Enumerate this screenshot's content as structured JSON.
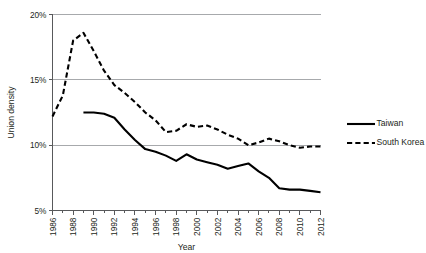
{
  "chart_data": {
    "type": "line",
    "title": "",
    "xlabel": "Year",
    "ylabel": "Union density",
    "xlim": [
      1986,
      2012
    ],
    "ylim": [
      5,
      20
    ],
    "y_tick_labels": [
      "5%",
      "10%",
      "15%",
      "20%"
    ],
    "y_ticks": [
      5,
      10,
      15,
      20
    ],
    "x_tick_labels": [
      "1986",
      "1988",
      "1990",
      "1992",
      "1994",
      "1996",
      "1998",
      "2000",
      "2002",
      "2004",
      "2006",
      "2008",
      "2010",
      "2012"
    ],
    "x_ticks": [
      1986,
      1988,
      1990,
      1992,
      1994,
      1996,
      1998,
      2000,
      2002,
      2004,
      2006,
      2008,
      2010,
      2012
    ],
    "grid": "horizontal",
    "legend_position": "right",
    "y_axis_unit": "percent",
    "colors": {
      "line": "#000000",
      "gridline": "#a7a9ac",
      "axis": "#58595b",
      "text": "#231f20",
      "background": "#ffffff"
    },
    "x": [
      1986,
      1987,
      1988,
      1989,
      1990,
      1991,
      1992,
      1993,
      1994,
      1995,
      1996,
      1997,
      1998,
      1999,
      2000,
      2001,
      2002,
      2003,
      2004,
      2005,
      2006,
      2007,
      2008,
      2009,
      2010,
      2011,
      2012
    ],
    "series": [
      {
        "name": "Taiwan",
        "style": "solid",
        "x": [
          1989,
          1990,
          1991,
          1992,
          1993,
          1994,
          1995,
          1996,
          1997,
          1998,
          1999,
          2000,
          2001,
          2002,
          2003,
          2004,
          2005,
          2006,
          2007,
          2008,
          2009,
          2010,
          2011,
          2012
        ],
        "values": [
          12.5,
          12.5,
          12.4,
          12.1,
          11.2,
          10.4,
          9.7,
          9.5,
          9.2,
          8.8,
          9.3,
          8.9,
          8.7,
          8.5,
          8.2,
          8.4,
          8.6,
          8.0,
          7.5,
          6.7,
          6.6,
          6.6,
          6.5,
          6.4
        ]
      },
      {
        "name": "South Korea",
        "style": "dashed",
        "x": [
          1986,
          1987,
          1988,
          1989,
          1990,
          1991,
          1992,
          1993,
          1994,
          1995,
          1996,
          1997,
          1998,
          1999,
          2000,
          2001,
          2002,
          2003,
          2004,
          2005,
          2006,
          2007,
          2008,
          2009,
          2010,
          2011,
          2012
        ],
        "values": [
          12.2,
          13.8,
          18.0,
          18.6,
          17.2,
          15.7,
          14.6,
          14.0,
          13.3,
          12.5,
          11.9,
          11.0,
          11.1,
          11.6,
          11.4,
          11.5,
          11.2,
          10.8,
          10.5,
          10.0,
          10.2,
          10.5,
          10.3,
          10.0,
          9.8,
          9.9,
          9.9
        ]
      }
    ]
  }
}
